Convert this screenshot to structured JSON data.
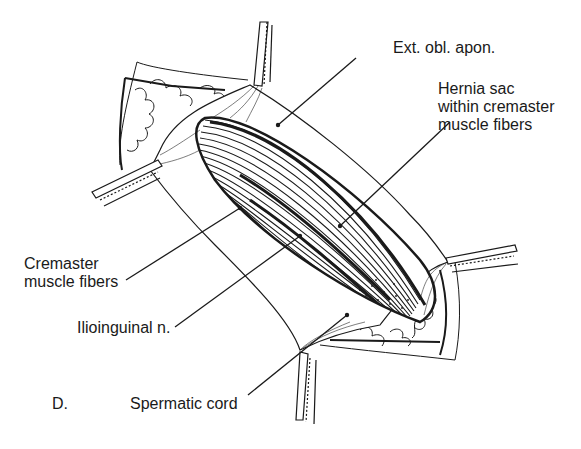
{
  "figure": {
    "panel_letter": "D.",
    "type": "surgical illustration",
    "labels": [
      {
        "id": "ext-obl-apon",
        "lines": [
          "Ext. obl. apon."
        ]
      },
      {
        "id": "hernia-sac",
        "lines": [
          "Hernia sac",
          "within cremaster",
          "muscle fibers"
        ]
      },
      {
        "id": "cremaster",
        "lines": [
          "Cremaster",
          "muscle fibers"
        ]
      },
      {
        "id": "ilioinguinal",
        "lines": [
          "Ilioinguinal n."
        ]
      },
      {
        "id": "spermatic-cord",
        "lines": [
          "Spermatic cord"
        ]
      }
    ]
  },
  "colors": {
    "ink": "#1a1a1a",
    "paper": "#ffffff"
  }
}
